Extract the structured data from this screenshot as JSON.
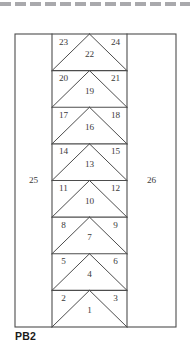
{
  "figure": {
    "caption": "PB2",
    "outer_region_left_label": "25",
    "outer_region_right_label": "26",
    "stroke_color": "#4d4d4d",
    "text_color": "#3a3a3a",
    "background_color": "#ffffff",
    "outer_box": {
      "x": 15,
      "y": 34,
      "width": 161,
      "height": 293
    },
    "center_column": {
      "x": 52,
      "width": 75
    },
    "band_count": 8,
    "bands": [
      {
        "index": 1,
        "left_label": "23",
        "center_label": "22",
        "right_label": "24"
      },
      {
        "index": 2,
        "left_label": "20",
        "center_label": "19",
        "right_label": "21"
      },
      {
        "index": 3,
        "left_label": "17",
        "center_label": "16",
        "right_label": "18"
      },
      {
        "index": 4,
        "left_label": "14",
        "center_label": "13",
        "right_label": "15"
      },
      {
        "index": 5,
        "left_label": "11",
        "center_label": "10",
        "right_label": "12"
      },
      {
        "index": 6,
        "left_label": "8",
        "center_label": "7",
        "right_label": "9"
      },
      {
        "index": 7,
        "left_label": "5",
        "center_label": "4",
        "right_label": "6"
      },
      {
        "index": 8,
        "left_label": "2",
        "center_label": "1",
        "right_label": "3"
      }
    ]
  }
}
